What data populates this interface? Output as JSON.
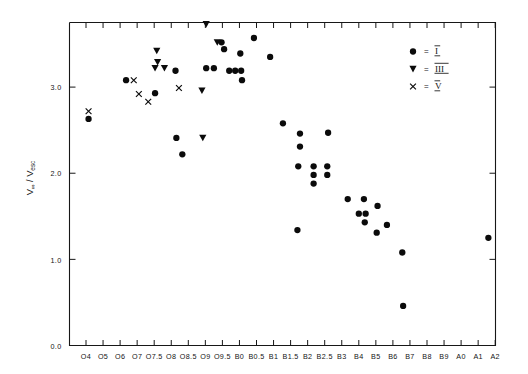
{
  "chart_data": {
    "type": "scatter",
    "title": "",
    "subtitle": "",
    "xlabel": "",
    "ylabel": "V∞ / V_esc",
    "ylabel_parts": {
      "main": "V",
      "sub1": "∞",
      "slash": "/",
      "main2": "V",
      "sub2": "esc"
    },
    "grid": false,
    "ylim": [
      0.0,
      3.75
    ],
    "yticks": [
      0.0,
      1.0,
      2.0,
      3.0
    ],
    "ytick_labels": [
      "0.0",
      "1.0",
      "2.0",
      "3.0"
    ],
    "xlim_index": [
      -1,
      25
    ],
    "categories": [
      "O4",
      "O5",
      "O6",
      "O7",
      "O7.5",
      "O8",
      "O8.5",
      "O9",
      "O9.5",
      "B0",
      "B0.5",
      "B1",
      "B1.5",
      "B2",
      "B2.5",
      "B3",
      "B4",
      "B5",
      "B6",
      "B7",
      "B8",
      "B9",
      "A0",
      "A1",
      "A2"
    ],
    "xtick_labels": [
      "O4",
      "O5",
      "O6",
      "O7",
      "O7.5",
      "O8",
      "O8.5",
      "O9",
      "O9.5",
      "B0",
      "B0.5",
      "B1",
      "B1.5",
      "B2",
      "B2.5",
      "B3",
      "B4",
      "B5",
      "B6",
      "B7",
      "B8",
      "B9",
      "A0",
      "A1",
      "A2"
    ],
    "legend_position": "top-right",
    "legend": [
      {
        "marker": "circle",
        "equals": "=",
        "label": "I"
      },
      {
        "marker": "triangle-down",
        "equals": "=",
        "label": "III"
      },
      {
        "marker": "cross",
        "equals": "=",
        "label": "V"
      }
    ],
    "series": [
      {
        "name": "I",
        "marker": "circle",
        "points": [
          {
            "x": 0.15,
            "y": 2.63
          },
          {
            "x": 2.35,
            "y": 3.08
          },
          {
            "x": 4.05,
            "y": 2.93
          },
          {
            "x": 5.25,
            "y": 3.19
          },
          {
            "x": 5.3,
            "y": 2.41
          },
          {
            "x": 5.65,
            "y": 2.22
          },
          {
            "x": 7.05,
            "y": 3.22
          },
          {
            "x": 7.5,
            "y": 3.22
          },
          {
            "x": 7.95,
            "y": 3.52
          },
          {
            "x": 8.1,
            "y": 3.44
          },
          {
            "x": 8.4,
            "y": 3.19
          },
          {
            "x": 8.75,
            "y": 3.19
          },
          {
            "x": 9.05,
            "y": 3.39
          },
          {
            "x": 9.1,
            "y": 3.19
          },
          {
            "x": 9.15,
            "y": 3.08
          },
          {
            "x": 9.85,
            "y": 3.57
          },
          {
            "x": 10.8,
            "y": 3.35
          },
          {
            "x": 11.55,
            "y": 2.58
          },
          {
            "x": 12.55,
            "y": 2.46
          },
          {
            "x": 12.55,
            "y": 2.31
          },
          {
            "x": 14.2,
            "y": 2.47
          },
          {
            "x": 12.45,
            "y": 2.08
          },
          {
            "x": 13.35,
            "y": 2.08
          },
          {
            "x": 13.35,
            "y": 1.98
          },
          {
            "x": 13.35,
            "y": 1.88
          },
          {
            "x": 14.15,
            "y": 2.08
          },
          {
            "x": 14.15,
            "y": 1.98
          },
          {
            "x": 12.4,
            "y": 1.34
          },
          {
            "x": 15.35,
            "y": 1.7
          },
          {
            "x": 16.3,
            "y": 1.7
          },
          {
            "x": 17.1,
            "y": 1.62
          },
          {
            "x": 16.0,
            "y": 1.53
          },
          {
            "x": 16.4,
            "y": 1.53
          },
          {
            "x": 16.35,
            "y": 1.43
          },
          {
            "x": 17.65,
            "y": 1.4
          },
          {
            "x": 17.05,
            "y": 1.31
          },
          {
            "x": 18.55,
            "y": 1.08
          },
          {
            "x": 18.6,
            "y": 0.46
          },
          {
            "x": 23.6,
            "y": 1.25
          }
        ]
      },
      {
        "name": "III",
        "marker": "triangle-down",
        "points": [
          {
            "x": 4.15,
            "y": 3.42
          },
          {
            "x": 4.2,
            "y": 3.29
          },
          {
            "x": 4.05,
            "y": 3.22
          },
          {
            "x": 4.6,
            "y": 3.22
          },
          {
            "x": 7.05,
            "y": 3.73
          },
          {
            "x": 7.7,
            "y": 3.52
          },
          {
            "x": 6.8,
            "y": 2.96
          },
          {
            "x": 6.85,
            "y": 2.41
          }
        ]
      },
      {
        "name": "V",
        "marker": "cross",
        "points": [
          {
            "x": 0.15,
            "y": 2.72
          },
          {
            "x": 2.8,
            "y": 3.08
          },
          {
            "x": 3.1,
            "y": 2.92
          },
          {
            "x": 3.65,
            "y": 2.83
          },
          {
            "x": 5.45,
            "y": 2.99
          }
        ]
      }
    ]
  },
  "axes": {
    "left_spine": true,
    "bottom_spine": true,
    "right_spine": true,
    "top_spine": true,
    "tick_direction": "in"
  }
}
